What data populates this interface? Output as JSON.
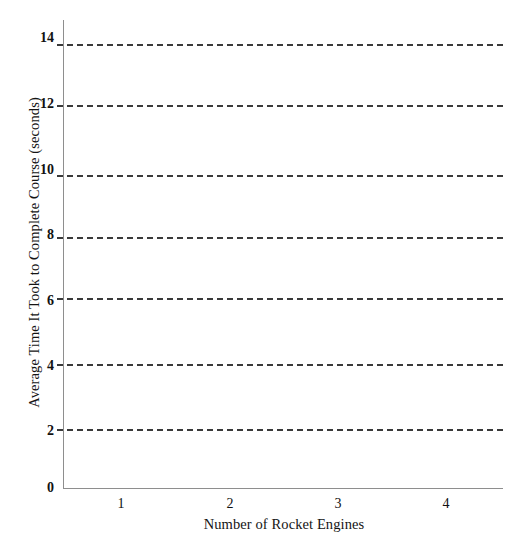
{
  "chart_data": {
    "type": "line",
    "title": "",
    "subtitle": "",
    "xlabel": "Number of Rocket Engines",
    "ylabel": "Average Time It Took to Complete Course (seconds)",
    "xlim": [
      0.5,
      4.5
    ],
    "ylim": [
      0,
      15
    ],
    "x_tick_labels": [
      "1",
      "2",
      "3",
      "4"
    ],
    "x_tick_values": [
      1,
      2,
      3,
      4
    ],
    "y_tick_labels": [
      "0",
      "2",
      "4",
      "6",
      "8",
      "10",
      "12",
      "14"
    ],
    "y_tick_values": [
      0,
      2,
      4,
      6,
      8,
      10,
      12,
      14
    ],
    "grid": false,
    "legend": null,
    "line_style": "dashed",
    "line_color": "#3a3a3a",
    "axis_color": "#8e8e8e",
    "series": [
      {
        "name": "reference-level-1",
        "values": [
          13.8,
          13.8,
          13.8,
          13.8
        ],
        "level": 13.8
      },
      {
        "name": "reference-level-2",
        "values": [
          11.95,
          11.95,
          11.95,
          11.95
        ],
        "level": 11.95
      },
      {
        "name": "reference-level-3",
        "values": [
          9.7,
          9.7,
          9.7,
          9.7
        ],
        "level": 9.7
      },
      {
        "name": "reference-level-4",
        "values": [
          7.85,
          7.85,
          7.85,
          7.85
        ],
        "level": 7.85
      },
      {
        "name": "reference-level-5",
        "values": [
          5.95,
          5.95,
          5.95,
          5.95
        ],
        "level": 5.95
      },
      {
        "name": "reference-level-6",
        "values": [
          3.85,
          3.85,
          3.85,
          3.85
        ],
        "level": 3.85
      },
      {
        "name": "reference-level-7",
        "values": [
          1.85,
          1.85,
          1.85,
          1.85
        ],
        "level": 1.85
      }
    ]
  },
  "axes": {
    "y_title": "Average Time It Took to Complete Course (seconds)",
    "x_title": "Number of Rocket Engines"
  },
  "y_ticks": [
    {
      "label": "14",
      "top": 31
    },
    {
      "label": "12",
      "top": 97
    },
    {
      "label": "10",
      "top": 163
    },
    {
      "label": "8",
      "top": 228
    },
    {
      "label": "6",
      "top": 294
    },
    {
      "label": "4",
      "top": 359
    },
    {
      "label": "2",
      "top": 424
    },
    {
      "label": "0",
      "top": 481
    }
  ],
  "x_ticks": [
    {
      "label": "1",
      "left": 108
    },
    {
      "label": "2",
      "left": 217
    },
    {
      "label": "3",
      "left": 325
    },
    {
      "label": "4",
      "left": 433
    }
  ],
  "lines": [
    {
      "name": "data-line-1",
      "top": 44
    },
    {
      "name": "data-line-2",
      "top": 105
    },
    {
      "name": "data-line-3",
      "top": 175
    },
    {
      "name": "data-line-4",
      "top": 237
    },
    {
      "name": "data-line-5",
      "top": 298
    },
    {
      "name": "data-line-6",
      "top": 364
    },
    {
      "name": "data-line-7",
      "top": 429
    }
  ]
}
